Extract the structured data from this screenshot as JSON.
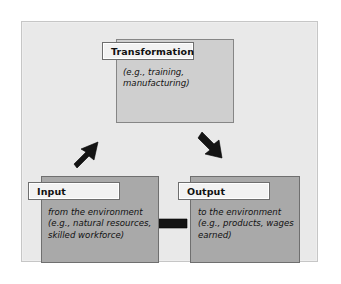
{
  "diagram": {
    "panel_background": "#e9e9e9",
    "box_fill_light": "#cfcfcf",
    "box_fill_mid": "#a9a9a9",
    "arrow_color": "#141414",
    "nodes": [
      {
        "id": "transformation",
        "label": "Transformation",
        "body": "(e.g., training,\nmanufacturing)"
      },
      {
        "id": "input",
        "label": "Input",
        "body": "from the environment\n(e.g., natural resources,\nskilled workforce)"
      },
      {
        "id": "output",
        "label": "Output",
        "body": "to the environment\n(e.g., products, wages\nearned)"
      }
    ],
    "arrows": [
      {
        "id": "input-to-transformation",
        "direction": "up-right",
        "from": "input",
        "to": "transformation"
      },
      {
        "id": "transformation-to-output",
        "direction": "down-right",
        "from": "transformation",
        "to": "output"
      },
      {
        "id": "output-to-input",
        "direction": "left",
        "from": "output",
        "to": "input"
      }
    ]
  }
}
